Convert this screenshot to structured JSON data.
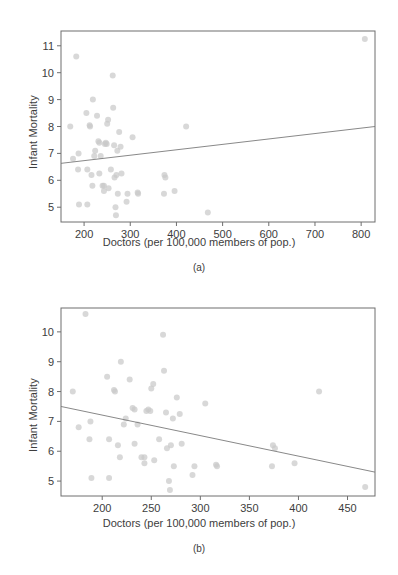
{
  "figure": {
    "shared_xlabel": "Doctors (per 100,000 members of pop.)",
    "shared_ylabel": "Infant Mortality",
    "caption_a": "(a)",
    "caption_b": "(b)",
    "marker_color": "#c9c9c9",
    "line_color": "#7a7a7a",
    "frame_color": "#6e6e6e"
  },
  "chart_data": [
    {
      "type": "scatter",
      "panel": "(a)",
      "title": "",
      "xlabel": "Doctors (per 100,000 members of pop.)",
      "ylabel": "Infant Mortality",
      "xlim": [
        150,
        830
      ],
      "ylim": [
        4.45,
        11.55
      ],
      "xticks": [
        200,
        300,
        400,
        500,
        600,
        700,
        800
      ],
      "xticklabels": [
        "200",
        "300",
        "400",
        "500",
        "600",
        "700",
        "800"
      ],
      "yticks": [
        5,
        6,
        7,
        8,
        9,
        10,
        11
      ],
      "yticklabels": [
        "5",
        "6",
        "7",
        "8",
        "9",
        "10",
        "11"
      ],
      "grid": false,
      "legend": "none",
      "trendline": {
        "x": [
          150,
          830
        ],
        "y": [
          6.63,
          8.0
        ],
        "direction": "positive"
      },
      "points": [
        [
          183,
          10.6
        ],
        [
          170,
          8.0
        ],
        [
          176,
          6.8
        ],
        [
          188,
          7.0
        ],
        [
          187,
          6.4
        ],
        [
          189,
          5.1
        ],
        [
          205,
          8.5
        ],
        [
          207,
          6.4
        ],
        [
          207,
          5.1
        ],
        [
          212,
          8.05
        ],
        [
          213,
          8.0
        ],
        [
          216,
          6.2
        ],
        [
          219,
          9.0
        ],
        [
          218,
          5.8
        ],
        [
          222,
          6.9
        ],
        [
          224,
          7.1
        ],
        [
          228,
          8.4
        ],
        [
          231,
          7.45
        ],
        [
          233,
          7.4
        ],
        [
          233,
          6.25
        ],
        [
          236,
          6.9
        ],
        [
          240,
          5.8
        ],
        [
          243,
          5.8
        ],
        [
          243,
          5.6
        ],
        [
          245,
          7.35
        ],
        [
          247,
          7.4
        ],
        [
          249,
          7.35
        ],
        [
          250,
          8.1
        ],
        [
          252,
          8.25
        ],
        [
          253,
          5.7
        ],
        [
          258,
          6.4
        ],
        [
          262,
          9.9
        ],
        [
          263,
          8.7
        ],
        [
          265,
          7.3
        ],
        [
          266,
          6.1
        ],
        [
          268,
          5.0
        ],
        [
          269,
          4.7
        ],
        [
          270,
          6.2
        ],
        [
          272,
          7.1
        ],
        [
          273,
          5.5
        ],
        [
          276,
          7.8
        ],
        [
          279,
          7.25
        ],
        [
          281,
          6.25
        ],
        [
          292,
          5.2
        ],
        [
          294,
          5.5
        ],
        [
          305,
          7.6
        ],
        [
          316,
          5.55
        ],
        [
          317,
          5.5
        ],
        [
          374,
          6.2
        ],
        [
          376,
          6.1
        ],
        [
          373,
          5.5
        ],
        [
          396,
          5.6
        ],
        [
          421,
          8.0
        ],
        [
          468,
          4.8
        ],
        [
          808,
          11.25
        ]
      ]
    },
    {
      "type": "scatter",
      "panel": "(b)",
      "title": "",
      "xlabel": "Doctors (per 100,000 members of pop.)",
      "ylabel": "Infant Mortality",
      "xlim": [
        158,
        478
      ],
      "ylim": [
        4.5,
        10.8
      ],
      "xticks": [
        200,
        250,
        300,
        350,
        400,
        450
      ],
      "xticklabels": [
        "200",
        "250",
        "300",
        "350",
        "400",
        "450"
      ],
      "yticks": [
        5,
        6,
        7,
        8,
        9,
        10
      ],
      "yticklabels": [
        "5",
        "6",
        "7",
        "8",
        "9",
        "10"
      ],
      "grid": false,
      "legend": "none",
      "trendline": {
        "x": [
          158,
          478
        ],
        "y": [
          7.5,
          5.3
        ],
        "direction": "negative"
      },
      "points": [
        [
          183,
          10.6
        ],
        [
          170,
          8.0
        ],
        [
          176,
          6.8
        ],
        [
          188,
          7.0
        ],
        [
          187,
          6.4
        ],
        [
          189,
          5.1
        ],
        [
          205,
          8.5
        ],
        [
          207,
          6.4
        ],
        [
          207,
          5.1
        ],
        [
          212,
          8.05
        ],
        [
          213,
          8.0
        ],
        [
          216,
          6.2
        ],
        [
          219,
          9.0
        ],
        [
          218,
          5.8
        ],
        [
          222,
          6.9
        ],
        [
          224,
          7.1
        ],
        [
          228,
          8.4
        ],
        [
          231,
          7.45
        ],
        [
          233,
          7.4
        ],
        [
          233,
          6.25
        ],
        [
          236,
          6.9
        ],
        [
          240,
          5.8
        ],
        [
          243,
          5.8
        ],
        [
          243,
          5.6
        ],
        [
          245,
          7.35
        ],
        [
          247,
          7.4
        ],
        [
          249,
          7.35
        ],
        [
          250,
          8.1
        ],
        [
          252,
          8.25
        ],
        [
          253,
          5.7
        ],
        [
          258,
          6.4
        ],
        [
          262,
          9.9
        ],
        [
          263,
          8.7
        ],
        [
          265,
          7.3
        ],
        [
          266,
          6.1
        ],
        [
          268,
          5.0
        ],
        [
          269,
          4.7
        ],
        [
          270,
          6.2
        ],
        [
          272,
          7.1
        ],
        [
          273,
          5.5
        ],
        [
          276,
          7.8
        ],
        [
          279,
          7.25
        ],
        [
          281,
          6.25
        ],
        [
          292,
          5.2
        ],
        [
          294,
          5.5
        ],
        [
          305,
          7.6
        ],
        [
          316,
          5.55
        ],
        [
          317,
          5.5
        ],
        [
          374,
          6.2
        ],
        [
          376,
          6.1
        ],
        [
          373,
          5.5
        ],
        [
          396,
          5.6
        ],
        [
          421,
          8.0
        ],
        [
          468,
          4.8
        ]
      ]
    }
  ]
}
